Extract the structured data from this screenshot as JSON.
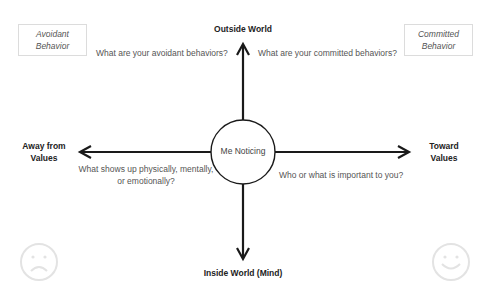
{
  "corner_boxes": {
    "avoidant": {
      "line1": "Avoidant",
      "line2": "Behavior"
    },
    "committed": {
      "line1": "Committed",
      "line2": "Behavior"
    }
  },
  "axes": {
    "top": "Outside World",
    "bottom": "Inside World (Mind)",
    "left": {
      "line1": "Away from",
      "line2": "Values"
    },
    "right": {
      "line1": "Toward",
      "line2": "Values"
    }
  },
  "center": "Me Noticing",
  "questions": {
    "top_left": "What are your avoidant behaviors?",
    "top_right": "What are your committed behaviors?",
    "bottom_left": {
      "line1": "What shows up physically, mentally,",
      "line2": "or emotionally?"
    },
    "bottom_right": "Who or what is important to you?"
  },
  "icons": {
    "left_face": "sad-face-icon",
    "right_face": "happy-face-icon"
  },
  "colors": {
    "line": "#1a1a1a",
    "face": "#e6e6e6",
    "box_border": "#dcdcdc"
  }
}
